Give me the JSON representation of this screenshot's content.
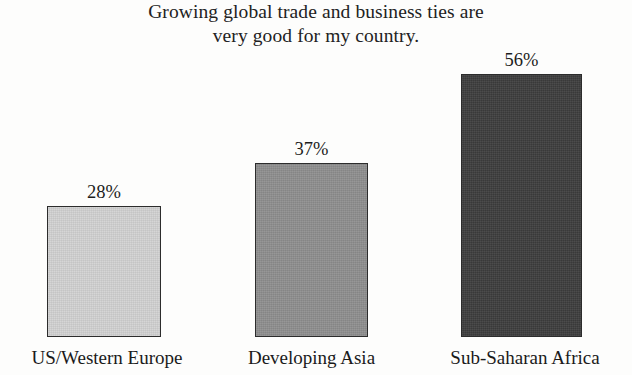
{
  "chart_data": {
    "type": "bar",
    "title": "Growing global trade and business ties are very good for my country.",
    "title_lines": [
      "Growing global trade and business ties are",
      "very good for my country."
    ],
    "categories": [
      "US/Western Europe",
      "Developing Asia",
      "Sub-Saharan Africa"
    ],
    "values": [
      28,
      37,
      56
    ],
    "value_labels": [
      "28%",
      "37%",
      "56%"
    ],
    "unit": "%",
    "xlabel": "",
    "ylabel": "",
    "ylim": [
      0,
      60
    ],
    "grid": false,
    "legend": false,
    "axis_visible": false,
    "bar_colors": [
      "#d2d2d2",
      "#8e8e8e",
      "#3d3d3d"
    ],
    "bar_border_color": "#2c2c2c",
    "background_color": "#fdfdfc",
    "text_color": "#1a1a1a"
  }
}
